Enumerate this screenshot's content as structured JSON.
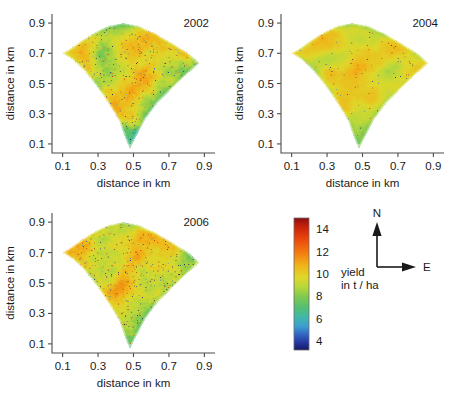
{
  "figure": {
    "kind": "multi-panel-yield-map",
    "panel_count": 3
  },
  "chart_data": {
    "type": "heatmap",
    "title": "",
    "subtitle": "",
    "panels": [
      {
        "year_label": "2002",
        "xlabel": "distance in km",
        "ylabel": "distance in km",
        "xticks": [
          0.1,
          0.3,
          0.5,
          0.7,
          0.9
        ],
        "yticks": [
          0.1,
          0.3,
          0.5,
          0.7,
          0.9
        ],
        "xticklabels": [
          "0.1",
          "0.3",
          "0.5",
          "0.7",
          "0.9"
        ],
        "yticklabels": [
          "0.1",
          "0.3",
          "0.5",
          "0.7",
          "0.9"
        ],
        "xlim": [
          0.04,
          0.96
        ],
        "ylim": [
          0.04,
          0.96
        ],
        "mean_yield": 9.6,
        "texture": "fine mottled, many red and dark-blue speckles, diagonal striping",
        "seed": 2002,
        "base_level": 9.6,
        "contrast": 2.6,
        "speckle": 0.55
      },
      {
        "year_label": "2004",
        "xlabel": "distance in km",
        "ylabel": "distance in km",
        "xticks": [
          0.1,
          0.3,
          0.5,
          0.7,
          0.9
        ],
        "yticks": [
          0.1,
          0.3,
          0.5,
          0.7,
          0.9
        ],
        "xticklabels": [
          "0.1",
          "0.3",
          "0.5",
          "0.7",
          "0.9"
        ],
        "yticklabels": [
          "0.1",
          "0.3",
          "0.5",
          "0.7",
          "0.9"
        ],
        "xlim": [
          0.04,
          0.96
        ],
        "ylim": [
          0.04,
          0.96
        ],
        "mean_yield": 9.9,
        "texture": "smooth green with yellow-orange bands in centre, few dark points",
        "seed": 2004,
        "base_level": 9.9,
        "contrast": 1.7,
        "speckle": 0.22
      },
      {
        "year_label": "2006",
        "xlabel": "distance in km",
        "ylabel": "distance in km",
        "xticks": [
          0.1,
          0.3,
          0.5,
          0.7,
          0.9
        ],
        "yticks": [
          0.1,
          0.3,
          0.5,
          0.7,
          0.9
        ],
        "xticklabels": [
          "0.1",
          "0.3",
          "0.5",
          "0.7",
          "0.9"
        ],
        "yticklabels": [
          "0.1",
          "0.3",
          "0.5",
          "0.7",
          "0.9"
        ],
        "xlim": [
          0.04,
          0.96
        ],
        "ylim": [
          0.04,
          0.96
        ],
        "mean_yield": 9.8,
        "texture": "yellow-green with dense dark speckles, blue tail at bottom",
        "seed": 2006,
        "base_level": 9.9,
        "contrast": 2.2,
        "speckle": 0.62
      }
    ],
    "field_polygon": [
      [
        0.1,
        0.7
      ],
      [
        0.15,
        0.735
      ],
      [
        0.215,
        0.79
      ],
      [
        0.285,
        0.84
      ],
      [
        0.36,
        0.88
      ],
      [
        0.44,
        0.9
      ],
      [
        0.53,
        0.88
      ],
      [
        0.625,
        0.83
      ],
      [
        0.72,
        0.765
      ],
      [
        0.81,
        0.7
      ],
      [
        0.87,
        0.635
      ],
      [
        0.8,
        0.56
      ],
      [
        0.72,
        0.47
      ],
      [
        0.64,
        0.38
      ],
      [
        0.57,
        0.27
      ],
      [
        0.52,
        0.16
      ],
      [
        0.48,
        0.068
      ],
      [
        0.45,
        0.15
      ],
      [
        0.42,
        0.25
      ],
      [
        0.38,
        0.33
      ],
      [
        0.33,
        0.42
      ],
      [
        0.275,
        0.51
      ],
      [
        0.215,
        0.595
      ],
      [
        0.155,
        0.66
      ]
    ],
    "colorbar": {
      "label_line1": "yield",
      "label_line2": "in t / ha",
      "ticks": [
        14,
        12,
        10,
        8,
        6,
        4
      ],
      "ticklabels": [
        "14",
        "12",
        "10",
        "8",
        "6",
        "4"
      ],
      "vmin": 3.2,
      "vmax": 15.0,
      "orientation": "vertical",
      "colormap": "jet",
      "stops": [
        {
          "pos": 0.0,
          "color": "#8b0d0d"
        },
        {
          "pos": 0.06,
          "color": "#c41f0a"
        },
        {
          "pos": 0.15,
          "color": "#e8420b"
        },
        {
          "pos": 0.26,
          "color": "#f37a0f"
        },
        {
          "pos": 0.36,
          "color": "#f0b419"
        },
        {
          "pos": 0.45,
          "color": "#dfd72a"
        },
        {
          "pos": 0.52,
          "color": "#b9d73b"
        },
        {
          "pos": 0.6,
          "color": "#7ec84f"
        },
        {
          "pos": 0.68,
          "color": "#52bf76"
        },
        {
          "pos": 0.75,
          "color": "#41b8a8"
        },
        {
          "pos": 0.82,
          "color": "#3c9ed0"
        },
        {
          "pos": 0.89,
          "color": "#2f5fc0"
        },
        {
          "pos": 0.95,
          "color": "#23339c"
        },
        {
          "pos": 1.0,
          "color": "#141a63"
        }
      ]
    },
    "compass": {
      "north_label": "N",
      "east_label": "E"
    },
    "grid": false,
    "legend_position": "bottom-right"
  }
}
